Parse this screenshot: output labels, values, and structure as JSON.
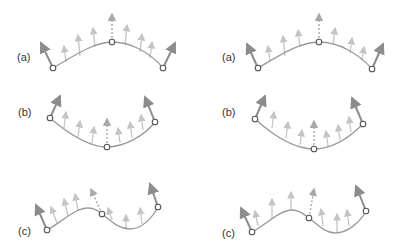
{
  "figure": {
    "colors": {
      "curve": "#9a9a9a",
      "strong_arrow": "#8c8c8c",
      "faint_arrow": "#c4c4c4",
      "dashed_arrow": "#a8a8a8",
      "node_stroke": "#555555",
      "label": "#333333"
    },
    "panels": [
      {
        "id": "left-a",
        "label": "(a)",
        "label_pos": [
          17,
          51
        ],
        "curve": "M53,68 C75,55 95,42 112,42 C130,42 150,52 163,68",
        "nodes": [
          [
            53,
            68
          ],
          [
            112,
            42
          ],
          [
            163,
            68
          ]
        ],
        "strong_arrows": [
          [
            53,
            68,
            41,
            43
          ],
          [
            163,
            68,
            175,
            43
          ]
        ],
        "dashed_arrow": [
          112,
          42,
          112,
          14
        ],
        "faint_arrows": [
          [
            66,
            62,
            64,
            46
          ],
          [
            80,
            56,
            78,
            35
          ],
          [
            95,
            47,
            93,
            28
          ],
          [
            125,
            45,
            127,
            25
          ],
          [
            140,
            52,
            142,
            34
          ],
          [
            150,
            58,
            152,
            42
          ]
        ]
      },
      {
        "id": "right-a",
        "label": "(a)",
        "label_pos": [
          222,
          51
        ],
        "curve": "M258,68 C280,55 300,42 319,42 C338,42 358,53 372,69",
        "nodes": [
          [
            258,
            68
          ],
          [
            319,
            42
          ],
          [
            372,
            69
          ]
        ],
        "strong_arrows": [
          [
            258,
            68,
            247,
            44
          ],
          [
            372,
            69,
            383,
            44
          ]
        ],
        "dashed_arrow": [
          319,
          42,
          319,
          14
        ],
        "faint_arrows": [
          [
            270,
            62,
            268,
            46
          ],
          [
            285,
            56,
            283,
            36
          ],
          [
            300,
            47,
            298,
            30
          ],
          [
            333,
            45,
            335,
            28
          ],
          [
            350,
            53,
            352,
            38
          ],
          [
            362,
            60,
            364,
            47
          ]
        ]
      },
      {
        "id": "left-b",
        "label": "(b)",
        "label_pos": [
          18,
          106
        ],
        "curve": "M50,118 C70,135 90,147 107,147 C125,147 145,135 155,122",
        "nodes": [
          [
            50,
            118
          ],
          [
            107,
            147
          ],
          [
            155,
            122
          ]
        ],
        "strong_arrows": [
          [
            50,
            118,
            60,
            96
          ],
          [
            155,
            122,
            145,
            97
          ]
        ],
        "dashed_arrow": [
          107,
          147,
          107,
          119
        ],
        "faint_arrows": [
          [
            64,
            128,
            66,
            112
          ],
          [
            78,
            137,
            80,
            121
          ],
          [
            92,
            143,
            94,
            127
          ],
          [
            120,
            143,
            118,
            128
          ],
          [
            132,
            138,
            130,
            122
          ],
          [
            143,
            130,
            141,
            115
          ]
        ]
      },
      {
        "id": "right-b",
        "label": "(b)",
        "label_pos": [
          222,
          106
        ],
        "curve": "M255,119 C275,137 295,149 314,149 C333,149 350,137 363,124",
        "nodes": [
          [
            255,
            119
          ],
          [
            314,
            149
          ],
          [
            363,
            124
          ]
        ],
        "strong_arrows": [
          [
            255,
            119,
            265,
            96
          ],
          [
            363,
            124,
            352,
            98
          ]
        ],
        "dashed_arrow": [
          314,
          149,
          314,
          121
        ],
        "faint_arrows": [
          [
            272,
            128,
            274,
            112
          ],
          [
            286,
            138,
            288,
            122
          ],
          [
            300,
            145,
            302,
            130
          ],
          [
            328,
            146,
            326,
            131
          ],
          [
            340,
            140,
            338,
            125
          ],
          [
            351,
            132,
            349,
            117
          ]
        ]
      },
      {
        "id": "left-c",
        "label": "(c)",
        "label_pos": [
          18,
          225
        ],
        "curve": "M47,230 C62,222 75,208 88,208 C96,208 99,212 102,214 C110,220 118,229 130,229 C142,229 152,218 158,207",
        "nodes": [
          [
            47,
            230
          ],
          [
            102,
            214
          ],
          [
            158,
            207
          ]
        ],
        "strong_arrows": [
          [
            47,
            230,
            36,
            205
          ],
          [
            158,
            207,
            150,
            184
          ]
        ],
        "dashed_arrow": [
          102,
          214,
          91,
          189
        ],
        "faint_arrows": [
          [
            57,
            223,
            51,
            207
          ],
          [
            68,
            216,
            64,
            199
          ],
          [
            78,
            211,
            75,
            194
          ],
          [
            112,
            220,
            108,
            208
          ],
          [
            126,
            228,
            126,
            215
          ],
          [
            142,
            224,
            140,
            208
          ]
        ]
      },
      {
        "id": "right-c",
        "label": "(c)",
        "label_pos": [
          222,
          227
        ],
        "curve": "M252,232 C267,224 280,210 292,210 C300,210 305,215 309,218 C317,224 325,233 335,233 C348,233 360,222 366,211",
        "nodes": [
          [
            252,
            232
          ],
          [
            309,
            218
          ],
          [
            366,
            211
          ]
        ],
        "strong_arrows": [
          [
            252,
            232,
            241,
            208
          ],
          [
            366,
            211,
            356,
            186
          ]
        ],
        "dashed_arrow": [
          309,
          218,
          314,
          189
        ],
        "faint_arrows": [
          [
            258,
            226,
            255,
            211
          ],
          [
            272,
            218,
            272,
            199
          ],
          [
            291,
            210,
            291,
            192
          ],
          [
            323,
            226,
            321,
            209
          ],
          [
            337,
            232,
            337,
            214
          ],
          [
            349,
            226,
            347,
            210
          ]
        ]
      }
    ]
  }
}
